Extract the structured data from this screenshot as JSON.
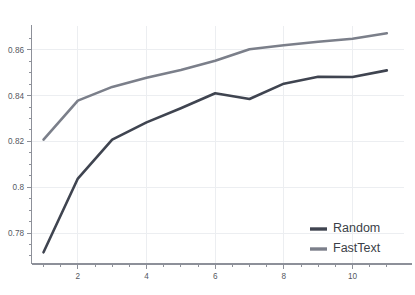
{
  "chart_data": {
    "type": "line",
    "title": "",
    "subtitle": "",
    "xlabel": "",
    "ylabel": "",
    "x": [
      1,
      2,
      3,
      4,
      5,
      6,
      7,
      8,
      9,
      10,
      11
    ],
    "xlim": [
      0.65,
      11.5
    ],
    "ylim": [
      0.7665,
      0.8695
    ],
    "xticks": [
      1,
      2,
      3,
      4,
      5,
      6,
      7,
      8,
      9,
      10,
      11
    ],
    "xtick_labels": [
      "",
      "2",
      "",
      "4",
      "",
      "6",
      "",
      "8",
      "",
      "10",
      ""
    ],
    "yticks": [
      0.77,
      0.775,
      0.78,
      0.785,
      0.79,
      0.795,
      0.8,
      0.805,
      0.81,
      0.815,
      0.82,
      0.825,
      0.83,
      0.835,
      0.84,
      0.845,
      0.85,
      0.855,
      0.86,
      0.865
    ],
    "ytick_labels": [
      "",
      "",
      "0.78",
      "",
      "",
      "",
      "0.8",
      "",
      "",
      "",
      "0.82",
      "",
      "",
      "",
      "0.84",
      "",
      "",
      "",
      "0.86",
      ""
    ],
    "ymajor": [
      0.78,
      0.8,
      0.82,
      0.84,
      0.86
    ],
    "grid": true,
    "grid_color": "#eceef1",
    "legend_position": "lower right",
    "legend_frame": false,
    "series": [
      {
        "name": "Random",
        "color": "#3f4450",
        "values": [
          0.7716,
          0.8038,
          0.8208,
          0.8283,
          0.8345,
          0.841,
          0.8385,
          0.8452,
          0.8482,
          0.8481,
          0.851
        ]
      },
      {
        "name": "FastText",
        "color": "#7b7f8a",
        "values": [
          0.8208,
          0.8378,
          0.8438,
          0.8478,
          0.8512,
          0.8552,
          0.8602,
          0.862,
          0.8635,
          0.8648,
          0.8672
        ]
      }
    ]
  },
  "legend": {
    "entries": [
      {
        "label": "Random",
        "color": "#3f4450"
      },
      {
        "label": "FastText",
        "color": "#7b7f8a"
      }
    ]
  },
  "caption": {
    "text": ""
  }
}
